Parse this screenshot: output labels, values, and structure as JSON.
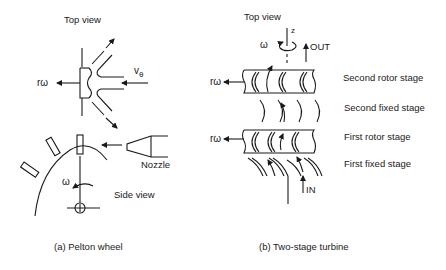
{
  "pelton": {
    "top_view": "Top view",
    "r_omega": "rω",
    "v_theta": "v",
    "v_theta_sub": "θ",
    "nozzle": "Nozzle",
    "side_view": "Side view",
    "omega": "ω",
    "caption": "(a) Pelton wheel"
  },
  "turbine": {
    "top_view": "Top view",
    "axis_z": "z",
    "omega": "ω",
    "out": "OUT",
    "in": "IN",
    "r_omega_upper": "rω",
    "r_omega_lower": "rω",
    "stages": [
      "Second rotor stage",
      "Second fixed stage",
      "First rotor stage",
      "First fixed stage"
    ],
    "caption": "(b) Two-stage turbine"
  },
  "colors": {
    "line": "#1a1a1a",
    "background": "#ffffff"
  }
}
